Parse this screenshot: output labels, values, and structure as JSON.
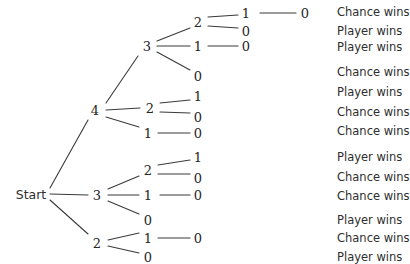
{
  "diagram": {
    "background_color": "#ffffff",
    "line_color": "#3a3a3a",
    "text_color": "#2e2e2e",
    "root": {
      "label": "Start",
      "x": 31,
      "y": 194
    },
    "nodes": [
      {
        "id": "n_4",
        "label": "4",
        "x": 95,
        "y": 110
      },
      {
        "id": "n_3_mid",
        "label": "3",
        "x": 97,
        "y": 195
      },
      {
        "id": "n_2_bot",
        "label": "2",
        "x": 97,
        "y": 243
      },
      {
        "id": "n_4_3",
        "label": "3",
        "x": 147,
        "y": 46
      },
      {
        "id": "n_4_2",
        "label": "2",
        "x": 150,
        "y": 108
      },
      {
        "id": "n_4_1",
        "label": "1",
        "x": 148,
        "y": 133
      },
      {
        "id": "n_3_2",
        "label": "2",
        "x": 148,
        "y": 170
      },
      {
        "id": "n_3_1",
        "label": "1",
        "x": 148,
        "y": 195
      },
      {
        "id": "n_3_0",
        "label": "0",
        "x": 148,
        "y": 220
      },
      {
        "id": "n_2_1",
        "label": "1",
        "x": 148,
        "y": 238
      },
      {
        "id": "n_2_0",
        "label": "0",
        "x": 148,
        "y": 257
      },
      {
        "id": "n_43_2",
        "label": "2",
        "x": 198,
        "y": 22
      },
      {
        "id": "n_43_1",
        "label": "1",
        "x": 198,
        "y": 46
      },
      {
        "id": "n_43_0",
        "label": "0",
        "x": 198,
        "y": 76
      },
      {
        "id": "n_42_1",
        "label": "1",
        "x": 198,
        "y": 96
      },
      {
        "id": "n_42_0",
        "label": "0",
        "x": 198,
        "y": 117
      },
      {
        "id": "n_41_0",
        "label": "0",
        "x": 198,
        "y": 133
      },
      {
        "id": "n_32_1",
        "label": "1",
        "x": 198,
        "y": 157
      },
      {
        "id": "n_32_0",
        "label": "0",
        "x": 198,
        "y": 178
      },
      {
        "id": "n_31_0",
        "label": "0",
        "x": 198,
        "y": 195
      },
      {
        "id": "n_21_0",
        "label": "0",
        "x": 198,
        "y": 238
      },
      {
        "id": "n_432_1",
        "label": "1",
        "x": 246,
        "y": 13
      },
      {
        "id": "n_432_0",
        "label": "0",
        "x": 246,
        "y": 31
      },
      {
        "id": "n_431_0",
        "label": "0",
        "x": 246,
        "y": 46
      },
      {
        "id": "n_4321_0",
        "label": "0",
        "x": 305,
        "y": 13
      }
    ],
    "edges": [
      {
        "from": "Start",
        "to": "n_4",
        "x1": 50,
        "y1": 188,
        "x2": 88,
        "y2": 120
      },
      {
        "from": "Start",
        "to": "n_3_mid",
        "x1": 50,
        "y1": 194,
        "x2": 88,
        "y2": 195
      },
      {
        "from": "Start",
        "to": "n_2_bot",
        "x1": 50,
        "y1": 200,
        "x2": 88,
        "y2": 234
      },
      {
        "from": "n_4",
        "to": "n_4_3",
        "x1": 106,
        "y1": 103,
        "x2": 138,
        "y2": 56
      },
      {
        "from": "n_4",
        "to": "n_4_2",
        "x1": 106,
        "y1": 110,
        "x2": 140,
        "y2": 108
      },
      {
        "from": "n_4",
        "to": "n_4_1",
        "x1": 106,
        "y1": 117,
        "x2": 139,
        "y2": 127
      },
      {
        "from": "n_3_mid",
        "to": "n_3_2",
        "x1": 108,
        "y1": 189,
        "x2": 139,
        "y2": 176
      },
      {
        "from": "n_3_mid",
        "to": "n_3_1",
        "x1": 108,
        "y1": 195,
        "x2": 139,
        "y2": 195
      },
      {
        "from": "n_3_mid",
        "to": "n_3_0",
        "x1": 108,
        "y1": 201,
        "x2": 139,
        "y2": 214
      },
      {
        "from": "n_2_bot",
        "to": "n_2_1",
        "x1": 108,
        "y1": 240,
        "x2": 139,
        "y2": 233
      },
      {
        "from": "n_2_bot",
        "to": "n_2_0",
        "x1": 108,
        "y1": 246,
        "x2": 139,
        "y2": 253
      },
      {
        "from": "n_4_3",
        "to": "n_43_2",
        "x1": 157,
        "y1": 41,
        "x2": 190,
        "y2": 28
      },
      {
        "from": "n_4_3",
        "to": "n_43_1",
        "x1": 157,
        "y1": 46,
        "x2": 190,
        "y2": 46
      },
      {
        "from": "n_4_3",
        "to": "n_43_0",
        "x1": 157,
        "y1": 52,
        "x2": 190,
        "y2": 70
      },
      {
        "from": "n_4_2",
        "to": "n_42_1",
        "x1": 160,
        "y1": 103,
        "x2": 190,
        "y2": 100
      },
      {
        "from": "n_4_2",
        "to": "n_42_0",
        "x1": 160,
        "y1": 112,
        "x2": 190,
        "y2": 113
      },
      {
        "from": "n_4_1",
        "to": "n_41_0",
        "x1": 158,
        "y1": 133,
        "x2": 190,
        "y2": 133
      },
      {
        "from": "n_3_2",
        "to": "n_32_1",
        "x1": 158,
        "y1": 165,
        "x2": 190,
        "y2": 160
      },
      {
        "from": "n_3_2",
        "to": "n_32_0",
        "x1": 158,
        "y1": 174,
        "x2": 190,
        "y2": 174
      },
      {
        "from": "n_3_1",
        "to": "n_31_0",
        "x1": 160,
        "y1": 195,
        "x2": 190,
        "y2": 195
      },
      {
        "from": "n_2_1",
        "to": "n_21_0",
        "x1": 158,
        "y1": 238,
        "x2": 190,
        "y2": 238
      },
      {
        "from": "n_43_2",
        "to": "n_432_1",
        "x1": 208,
        "y1": 17,
        "x2": 238,
        "y2": 15
      },
      {
        "from": "n_43_2",
        "to": "n_432_0",
        "x1": 208,
        "y1": 26,
        "x2": 238,
        "y2": 28
      },
      {
        "from": "n_43_1",
        "to": "n_431_0",
        "x1": 208,
        "y1": 46,
        "x2": 238,
        "y2": 46
      },
      {
        "from": "n_432_1",
        "to": "n_4321_0",
        "x1": 260,
        "y1": 13,
        "x2": 296,
        "y2": 13
      }
    ],
    "outcomes": [
      {
        "text": "Chance wins",
        "y": 12,
        "path": "4-3-2-1-0"
      },
      {
        "text": "Player wins",
        "y": 31,
        "path": "4-3-2-0"
      },
      {
        "text": "Player wins",
        "y": 47,
        "path": "4-3-1-0"
      },
      {
        "text": "Chance wins",
        "y": 72,
        "path": "4-3-0"
      },
      {
        "text": "Player wins",
        "y": 92,
        "path": "4-2-1-0"
      },
      {
        "text": "Chance wins",
        "y": 112,
        "path": "4-2-0"
      },
      {
        "text": "Chance wins",
        "y": 131,
        "path": "4-1-0"
      },
      {
        "text": "Player wins",
        "y": 157,
        "path": "3-2-1-0"
      },
      {
        "text": "Chance wins",
        "y": 177,
        "path": "3-2-0"
      },
      {
        "text": "Chance wins",
        "y": 196,
        "path": "3-1-0"
      },
      {
        "text": "Player wins",
        "y": 220,
        "path": "3-0"
      },
      {
        "text": "Chance wins",
        "y": 238,
        "path": "2-1-0"
      },
      {
        "text": "Player wins",
        "y": 257,
        "path": "2-0"
      }
    ]
  }
}
